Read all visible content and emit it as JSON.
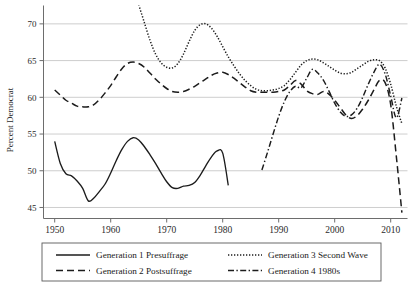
{
  "chart_data": {
    "type": "line",
    "title": "",
    "xlabel": "",
    "ylabel": "Percent Democrat",
    "xlim": [
      1948,
      2013
    ],
    "ylim": [
      43.5,
      72.5
    ],
    "grid": true,
    "legend_position": "below",
    "xticks": [
      1950,
      1960,
      1970,
      1980,
      1990,
      2000,
      2010
    ],
    "yticks": [
      45,
      50,
      55,
      60,
      65,
      70
    ],
    "series": [
      {
        "name": "Generation 1 Presuffrage",
        "style": "solid",
        "x": [
          1950,
          1951,
          1952,
          1953,
          1954,
          1955,
          1956,
          1957,
          1958,
          1959,
          1960,
          1961,
          1962,
          1963,
          1964,
          1965,
          1966,
          1967,
          1968,
          1969,
          1970,
          1971,
          1972,
          1973,
          1974,
          1975,
          1976,
          1977,
          1978,
          1979,
          1980,
          1981
        ],
        "y": [
          54.0,
          51.0,
          49.6,
          49.3,
          48.6,
          47.6,
          45.9,
          46.3,
          47.2,
          48.2,
          49.7,
          51.4,
          52.9,
          54.0,
          54.5,
          54.2,
          53.3,
          52.2,
          51.0,
          49.7,
          48.5,
          47.7,
          47.6,
          47.9,
          48.0,
          48.4,
          49.4,
          50.7,
          51.9,
          52.7,
          52.4,
          48.0
        ]
      },
      {
        "name": "Generation 2 Postsuffrage",
        "style": "dashed",
        "x": [
          1950,
          1951,
          1952,
          1953,
          1954,
          1955,
          1956,
          1957,
          1958,
          1959,
          1960,
          1961,
          1962,
          1963,
          1964,
          1965,
          1966,
          1967,
          1968,
          1969,
          1970,
          1971,
          1972,
          1973,
          1974,
          1975,
          1976,
          1977,
          1978,
          1979,
          1980,
          1981,
          1982,
          1983,
          1984,
          1985,
          1986,
          1987,
          1988,
          1989,
          1990,
          1991,
          1992,
          1993,
          1994,
          1995,
          1996,
          1997,
          1998,
          1999,
          2000,
          2001,
          2002,
          2003,
          2004,
          2005,
          2006,
          2007,
          2008,
          2009,
          2010,
          2011,
          2012
        ],
        "y": [
          61.0,
          60.3,
          59.6,
          59.2,
          58.8,
          58.7,
          58.7,
          59.0,
          59.7,
          60.6,
          61.6,
          62.8,
          63.9,
          64.6,
          64.8,
          64.6,
          64.1,
          63.3,
          62.5,
          61.8,
          61.2,
          60.8,
          60.7,
          60.8,
          61.1,
          61.5,
          62.0,
          62.5,
          63.0,
          63.3,
          63.4,
          63.1,
          62.6,
          62.0,
          61.4,
          60.9,
          60.7,
          60.7,
          60.7,
          60.7,
          60.8,
          61.0,
          61.6,
          62.3,
          61.8,
          60.9,
          60.5,
          60.4,
          60.8,
          60.4,
          59.6,
          58.6,
          57.6,
          57.1,
          57.5,
          58.4,
          59.6,
          61.0,
          62.3,
          62.0,
          59.0,
          52.0,
          44.3
        ]
      },
      {
        "name": "Generation 3 Second Wave",
        "style": "dotted",
        "x": [
          1965,
          1966,
          1967,
          1968,
          1969,
          1970,
          1971,
          1972,
          1973,
          1974,
          1975,
          1976,
          1977,
          1978,
          1979,
          1980,
          1981,
          1982,
          1983,
          1984,
          1985,
          1986,
          1987,
          1988,
          1989,
          1990,
          1991,
          1992,
          1993,
          1994,
          1995,
          1996,
          1997,
          1998,
          1999,
          2000,
          2001,
          2002,
          2003,
          2004,
          2005,
          2006,
          2007,
          2008,
          2009,
          2010,
          2011,
          2012
        ],
        "y": [
          72.6,
          70.2,
          67.8,
          65.9,
          64.7,
          64.1,
          64.0,
          64.6,
          65.9,
          67.6,
          69.1,
          69.9,
          70.0,
          69.4,
          68.3,
          66.9,
          65.5,
          64.3,
          63.2,
          62.3,
          61.6,
          61.1,
          60.9,
          60.9,
          61.0,
          61.2,
          61.6,
          62.4,
          63.4,
          64.4,
          65.0,
          65.2,
          65.1,
          64.7,
          64.2,
          63.7,
          63.3,
          63.2,
          63.4,
          63.9,
          64.4,
          64.9,
          65.1,
          65.0,
          64.0,
          61.8,
          58.8,
          56.4
        ]
      },
      {
        "name": "Generation 4 1980s",
        "style": "dashdot",
        "x": [
          1987,
          1988,
          1989,
          1990,
          1991,
          1992,
          1993,
          1994,
          1995,
          1996,
          1997,
          1998,
          1999,
          2000,
          2001,
          2002,
          2003,
          2004,
          2005,
          2006,
          2007,
          2008,
          2009,
          2010,
          2011,
          2012
        ],
        "y": [
          50.1,
          52.5,
          55.0,
          57.4,
          59.4,
          60.8,
          61.5,
          61.3,
          62.6,
          63.8,
          63.3,
          62.3,
          60.8,
          59.2,
          58.0,
          57.4,
          57.6,
          58.5,
          60.0,
          61.8,
          63.4,
          64.5,
          63.2,
          60.2,
          57.2,
          59.9
        ]
      }
    ]
  },
  "legend": {
    "entries": [
      {
        "label": "Generation 1 Presuffrage",
        "style": "solid"
      },
      {
        "label": "Generation 2 Postsuffrage",
        "style": "dashed"
      },
      {
        "label": "Generation 3 Second Wave",
        "style": "dotted"
      },
      {
        "label": "Generation 4 1980s",
        "style": "dashdot"
      }
    ]
  },
  "axes": {
    "y_title": "Percent Democrat",
    "y_tick_labels": [
      "70",
      "65",
      "60",
      "55",
      "50",
      "45"
    ],
    "x_tick_labels": [
      "1950",
      "1960",
      "1970",
      "1980",
      "1990",
      "2000",
      "2010"
    ]
  }
}
